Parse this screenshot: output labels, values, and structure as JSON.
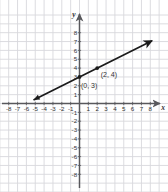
{
  "figure": {
    "kind": "coordinate-plane-graph",
    "background_color": "#ffffff",
    "grid_color": "#d8d8dd",
    "axis_color": "#58585c",
    "line_color": "#1a1a1a",
    "label_color": "#333333"
  },
  "chart_data": {
    "type": "line",
    "title": "",
    "xlabel": "x",
    "ylabel": "y",
    "xlim": [
      -8.6,
      8.6
    ],
    "ylim": [
      -8.6,
      8.6
    ],
    "grid": true,
    "legend": "none",
    "x_ticks": [
      -8,
      -7,
      -6,
      -5,
      -4,
      -3,
      -2,
      -1,
      1,
      2,
      3,
      4,
      5,
      6,
      7,
      8
    ],
    "y_ticks": [
      8,
      7,
      6,
      5,
      4,
      3,
      2,
      1,
      -1,
      -2,
      -3,
      -4,
      -5,
      -6,
      -7,
      -8
    ],
    "x_tick_labels": [
      "-8",
      "-7",
      "-6",
      "-5",
      "-4",
      "-3",
      "-2",
      "-1",
      "1",
      "2",
      "3",
      "4",
      "5",
      "6",
      "7",
      "8"
    ],
    "y_tick_labels": [
      "8",
      "7",
      "6",
      "5",
      "4",
      "3",
      "2",
      "1",
      "-1",
      "-2",
      "-3",
      "-4",
      "-5",
      "-6",
      "-7",
      "-8"
    ],
    "series": [
      {
        "name": "line",
        "equation": "y = 0.5x + 3",
        "slope": 0.5,
        "intercept": 3,
        "x": [
          -5.2,
          8.2
        ],
        "values": [
          0.4,
          7.1
        ],
        "arrows": "both",
        "points": [
          {
            "label": "(0, 3)",
            "x": 0,
            "y": 3
          },
          {
            "label": "(2, 4)",
            "x": 2,
            "y": 4
          }
        ]
      }
    ]
  },
  "axes": {
    "x_axis_label": "x",
    "y_axis_label": "y"
  },
  "annotations": [
    {
      "id": "point-label-0-3",
      "text": "(0, 3)",
      "x": 0,
      "y": 3
    },
    {
      "id": "point-label-2-4",
      "text": "(2, 4)",
      "x": 2,
      "y": 4
    }
  ]
}
